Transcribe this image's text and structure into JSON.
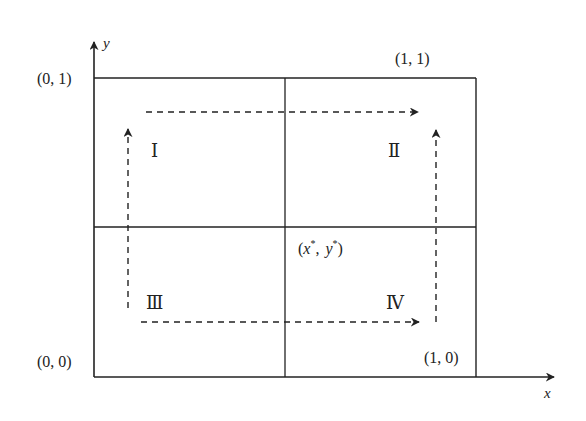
{
  "diagram": {
    "axes": {
      "x_label": "x",
      "y_label": "y"
    },
    "corners": {
      "origin": "(0, 0)",
      "top_left": "(0, 1)",
      "top_right": "(1, 1)",
      "bottom_right": "(1, 0)"
    },
    "center_point": {
      "open": "(",
      "x": "x",
      "star": "*",
      "sep": ",",
      "y": "y",
      "close": ")"
    },
    "quadrants": {
      "q1": "Ⅰ",
      "q2": "Ⅱ",
      "q3": "Ⅲ",
      "q4": "Ⅳ"
    },
    "flows": [
      {
        "from": "Ⅲ",
        "to": "Ⅰ",
        "direction": "up",
        "style": "dashed"
      },
      {
        "from": "Ⅰ",
        "to": "Ⅱ",
        "direction": "right",
        "style": "dashed"
      },
      {
        "from": "Ⅲ",
        "to": "Ⅳ",
        "direction": "right",
        "style": "dashed"
      },
      {
        "from": "Ⅳ",
        "to": "Ⅱ",
        "direction": "up",
        "style": "dashed"
      }
    ],
    "colors": {
      "line": "#222222",
      "background": "#ffffff"
    }
  }
}
